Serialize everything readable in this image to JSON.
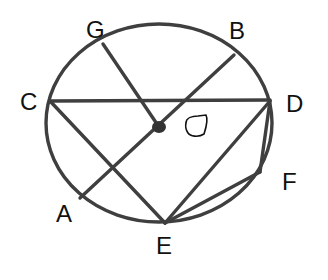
{
  "diagram": {
    "type": "circle-geometry",
    "circle": {
      "center_label": "O",
      "cx": 159,
      "cy": 123,
      "rx": 113,
      "ry": 99
    },
    "colors": {
      "stroke": "#3f3f3f",
      "text": "#111111",
      "background": "#ffffff"
    },
    "points": {
      "G": {
        "label": "G",
        "x": 103,
        "y": 44,
        "label_x": 86,
        "label_y": 38
      },
      "B": {
        "label": "B",
        "x": 234,
        "y": 55,
        "label_x": 229,
        "label_y": 39
      },
      "C": {
        "label": "C",
        "x": 50,
        "y": 101,
        "label_x": 20,
        "label_y": 110
      },
      "D": {
        "label": "D",
        "x": 270,
        "y": 101,
        "label_x": 286,
        "label_y": 112
      },
      "A": {
        "label": "A",
        "x": 80,
        "y": 198,
        "label_x": 56,
        "label_y": 222
      },
      "E": {
        "label": "E",
        "x": 165,
        "y": 223,
        "label_x": 156,
        "label_y": 254
      },
      "F": {
        "label": "F",
        "x": 260,
        "y": 172,
        "label_x": 282,
        "label_y": 190
      },
      "O": {
        "label": "O",
        "x": 159,
        "y": 127
      }
    },
    "segments": [
      {
        "from": "G",
        "to": "O"
      },
      {
        "from": "A",
        "to": "B"
      },
      {
        "from": "C",
        "to": "D"
      },
      {
        "from": "C",
        "to": "E"
      },
      {
        "from": "D",
        "to": "E"
      },
      {
        "from": "D",
        "to": "F"
      },
      {
        "from": "F",
        "to": "E"
      }
    ],
    "labels": [
      "G",
      "B",
      "C",
      "D",
      "A",
      "E",
      "F",
      "O"
    ]
  }
}
